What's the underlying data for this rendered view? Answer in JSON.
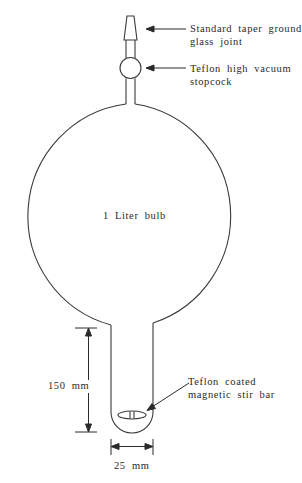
{
  "diagram": {
    "bulb_label": "1 Liter bulb",
    "callouts": [
      {
        "id": "joint",
        "line1": "Standard taper ground",
        "line2": "glass joint"
      },
      {
        "id": "stopcock",
        "line1": "Teflon high vacuum",
        "line2": "stopcock"
      },
      {
        "id": "stirbar",
        "line1": "Teflon coated",
        "line2": "magnetic stir bar"
      }
    ],
    "dimensions": {
      "height": "150 mm",
      "width": "25 mm"
    },
    "stroke_color": "#3a3a3a"
  }
}
